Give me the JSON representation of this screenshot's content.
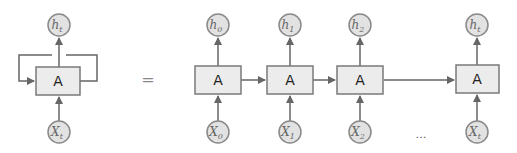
{
  "diagram": {
    "colors": {
      "box_fill": "#ececec",
      "box_stroke": "#7a7a7a",
      "circle_fill": "#e2e2e2",
      "circle_stroke": "#8a8a8a",
      "arrow": "#666666"
    },
    "equals_sign": "=",
    "ellipsis": "…",
    "rolled": {
      "cell_label": "A",
      "output": {
        "base": "h",
        "sub": "t"
      },
      "input": {
        "base": "X",
        "sub": "t"
      }
    },
    "unrolled": [
      {
        "cell_label": "A",
        "output": {
          "base": "h",
          "sub": "0"
        },
        "input": {
          "base": "X",
          "sub": "0"
        }
      },
      {
        "cell_label": "A",
        "output": {
          "base": "h",
          "sub": "1"
        },
        "input": {
          "base": "X",
          "sub": "1"
        }
      },
      {
        "cell_label": "A",
        "output": {
          "base": "h",
          "sub": "2"
        },
        "input": {
          "base": "X",
          "sub": "2"
        }
      },
      {
        "cell_label": "A",
        "output": {
          "base": "h",
          "sub": "t"
        },
        "input": {
          "base": "X",
          "sub": "t"
        }
      }
    ]
  }
}
